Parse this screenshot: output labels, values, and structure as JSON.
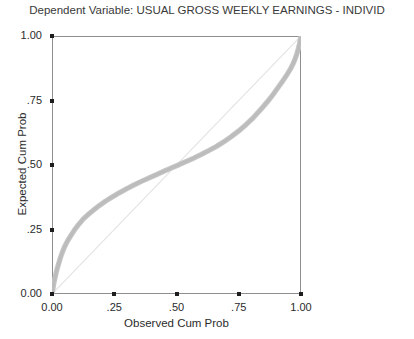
{
  "chart_data": {
    "type": "line",
    "title": "Dependent Variable: USUAL GROSS WEEKLY EARNINGS - INDIVID",
    "subtitle": "",
    "xlabel": "Observed Cum Prob",
    "ylabel": "Expected Cum Prob",
    "xlim": [
      0.0,
      1.0
    ],
    "ylim": [
      0.0,
      1.0
    ],
    "grid": false,
    "legend": null,
    "legend_position": "none",
    "xticks": [
      0.0,
      0.25,
      0.5,
      0.75,
      1.0
    ],
    "xtick_labels": [
      "0.00",
      ".25",
      ".50",
      ".75",
      "1.00"
    ],
    "yticks": [
      0.0,
      0.25,
      0.5,
      0.75,
      1.0
    ],
    "ytick_labels": [
      "0.00",
      ".25",
      ".50",
      ".75",
      "1.00"
    ],
    "series": [
      {
        "name": "Expected Cum Prob",
        "style": "dense-marker-band",
        "color": "#c6c6c6",
        "x": [
          0.0,
          0.004,
          0.008,
          0.012,
          0.016,
          0.02,
          0.026,
          0.032,
          0.04,
          0.05,
          0.062,
          0.075,
          0.09,
          0.105,
          0.125,
          0.145,
          0.165,
          0.19,
          0.215,
          0.24,
          0.27,
          0.3,
          0.33,
          0.36,
          0.39,
          0.42,
          0.45,
          0.48,
          0.51,
          0.54,
          0.57,
          0.6,
          0.63,
          0.66,
          0.69,
          0.72,
          0.75,
          0.78,
          0.81,
          0.84,
          0.865,
          0.89,
          0.91,
          0.93,
          0.945,
          0.958,
          0.968,
          0.976,
          0.983,
          0.989,
          0.994,
          0.997,
          1.0
        ],
        "y": [
          0.0,
          0.022,
          0.045,
          0.062,
          0.08,
          0.095,
          0.115,
          0.135,
          0.158,
          0.182,
          0.205,
          0.225,
          0.248,
          0.267,
          0.29,
          0.308,
          0.324,
          0.343,
          0.36,
          0.375,
          0.392,
          0.408,
          0.423,
          0.437,
          0.45,
          0.463,
          0.476,
          0.489,
          0.501,
          0.514,
          0.527,
          0.541,
          0.556,
          0.572,
          0.59,
          0.61,
          0.632,
          0.657,
          0.685,
          0.717,
          0.745,
          0.776,
          0.803,
          0.83,
          0.852,
          0.873,
          0.892,
          0.91,
          0.93,
          0.95,
          0.97,
          0.985,
          1.0
        ]
      },
      {
        "name": "reference-diagonal",
        "style": "thin-line",
        "color": "#e3e3e3",
        "x": [
          0.0,
          1.0
        ],
        "y": [
          0.0,
          1.0
        ]
      }
    ]
  },
  "axes": {
    "y_ticks": [
      {
        "label": "1.00",
        "value": 1.0
      },
      {
        "label": ".75",
        "value": 0.75
      },
      {
        "label": ".50",
        "value": 0.5
      },
      {
        "label": ".25",
        "value": 0.25
      },
      {
        "label": "0.00",
        "value": 0.0
      }
    ],
    "x_ticks": [
      {
        "label": "0.00",
        "value": 0.0
      },
      {
        "label": ".25",
        "value": 0.25
      },
      {
        "label": ".50",
        "value": 0.5
      },
      {
        "label": ".75",
        "value": 0.75
      },
      {
        "label": "1.00",
        "value": 1.0
      }
    ]
  }
}
